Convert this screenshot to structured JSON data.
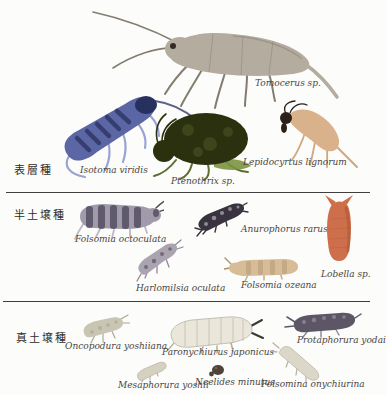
{
  "figure": {
    "background": "#fcfcfa",
    "divider_color": "#3f3f3f"
  },
  "groups": {
    "surface": {
      "label": "表層種"
    },
    "hemi": {
      "label": "半土壌種"
    },
    "eu": {
      "label": "真土壌種"
    }
  },
  "species": {
    "tomocerus": {
      "label": "Tomocerus sp.",
      "color": "#b3ac9f",
      "accent": "#847d6f"
    },
    "isotoma": {
      "label": "Isotoma viridis",
      "color": "#5b67a5",
      "accent": "#28305e",
      "legs": "#9aa4d4"
    },
    "ptenothrix": {
      "label": "Ptenothrix sp.",
      "color": "#2b300f",
      "accent": "#5c6c33",
      "legs": "#5c6c33",
      "patch": "#7a9440"
    },
    "lepidocyrtus": {
      "label": "Lepidocyrtus lignorum",
      "color": "#d9b18b",
      "accent": "#2b2119",
      "legs": "#cfa87f"
    },
    "f_octoculata": {
      "label": "Folsomia octoculata",
      "color": "#a09aab",
      "accent": "#4f4a5c",
      "legs": "#bdb9c6"
    },
    "anurophorus": {
      "label": "Anurophorus rarus",
      "color": "#39333f",
      "accent": "#a49eae"
    },
    "harlomilsia": {
      "label": "Harlomilsia oculata",
      "color": "#aaa3b0",
      "accent": "#5f5766",
      "legs": "#8f8896"
    },
    "f_ozeana": {
      "label": "Folsomia ozeana",
      "color": "#d6bd97",
      "accent": "#a98f68",
      "legs": "#c3ad88"
    },
    "lobella": {
      "label": "Lobella sp.",
      "color": "#ce6f4b",
      "accent": "#a85335"
    },
    "oncopodura": {
      "label": "Oncopodura yoshiiana",
      "color": "#c8c6b2",
      "accent": "#9a988a",
      "legs": "#aaa89a"
    },
    "paronychiurus": {
      "label": "Paronychiurus japonicus",
      "color": "#eae6da",
      "accent": "#b0aa9c",
      "legs": "#b5af9f",
      "spines": "#3f382e"
    },
    "protaphorura": {
      "label": "Protaphorura yodai",
      "color": "#5c5666",
      "accent": "#aaa4b2",
      "legs": "#8c8596"
    },
    "mesaphorura": {
      "label": "Mesaphorura yoshii",
      "color": "#d6d0c0",
      "legs": "#b9b2a0"
    },
    "neelides": {
      "label": "Neelides minutus",
      "color": "#4f4238",
      "accent": "#8a7a6a"
    },
    "folsomina": {
      "label": "Folsomina onychiurina",
      "color": "#dbd7c9",
      "legs": "#b8b4a4"
    }
  }
}
